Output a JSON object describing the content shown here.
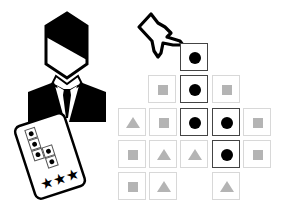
{
  "illustration": {
    "character": "businessman-in-suit",
    "held_card": {
      "pattern_dots": 6,
      "stars": 3
    },
    "pointer": "hand-pointing"
  },
  "grid": {
    "cell_size": 28,
    "colors": {
      "active_border": "#444444",
      "inactive_border": "#d8d8d8",
      "shape_fill": "#b4b4b4",
      "dot_fill": "#000000"
    },
    "cells": [
      {
        "row": 0,
        "col": 2,
        "shape": "dot",
        "active": true,
        "x": 180,
        "y": 43
      },
      {
        "row": 1,
        "col": 1,
        "shape": "square",
        "active": false,
        "x": 148,
        "y": 75
      },
      {
        "row": 1,
        "col": 2,
        "shape": "dot",
        "active": true,
        "x": 180,
        "y": 75
      },
      {
        "row": 1,
        "col": 3,
        "shape": "square",
        "active": false,
        "x": 212,
        "y": 75
      },
      {
        "row": 2,
        "col": 0,
        "shape": "triangle",
        "active": false,
        "x": 118,
        "y": 108
      },
      {
        "row": 2,
        "col": 1,
        "shape": "square",
        "active": false,
        "x": 149,
        "y": 108
      },
      {
        "row": 2,
        "col": 2,
        "shape": "dot",
        "active": true,
        "x": 180,
        "y": 108
      },
      {
        "row": 2,
        "col": 3,
        "shape": "dot",
        "active": true,
        "x": 212,
        "y": 108
      },
      {
        "row": 2,
        "col": 4,
        "shape": "square",
        "active": false,
        "x": 243,
        "y": 108
      },
      {
        "row": 3,
        "col": 0,
        "shape": "square",
        "active": false,
        "x": 118,
        "y": 140
      },
      {
        "row": 3,
        "col": 1,
        "shape": "triangle",
        "active": false,
        "x": 149,
        "y": 140
      },
      {
        "row": 3,
        "col": 2,
        "shape": "triangle",
        "active": false,
        "x": 180,
        "y": 140
      },
      {
        "row": 3,
        "col": 3,
        "shape": "dot",
        "active": true,
        "x": 212,
        "y": 140
      },
      {
        "row": 3,
        "col": 4,
        "shape": "square",
        "active": false,
        "x": 243,
        "y": 140
      },
      {
        "row": 4,
        "col": 0,
        "shape": "square",
        "active": false,
        "x": 118,
        "y": 172
      },
      {
        "row": 4,
        "col": 1,
        "shape": "triangle",
        "active": false,
        "x": 149,
        "y": 172
      },
      {
        "row": 4,
        "col": 3,
        "shape": "triangle",
        "active": false,
        "x": 212,
        "y": 172
      }
    ]
  }
}
